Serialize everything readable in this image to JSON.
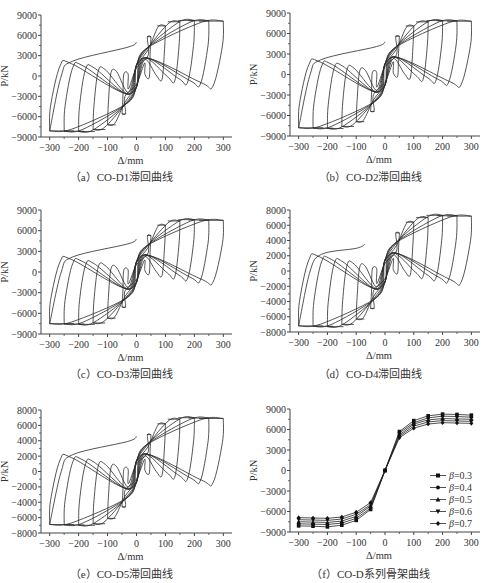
{
  "chart_data": [
    {
      "id": "a",
      "type": "line",
      "subtype": "hysteresis",
      "title": "（a）CO-D1滞回曲线",
      "caption_prefix": "（a）",
      "caption_text": "CO-D1滞回曲线",
      "xlabel": "Δ/mm",
      "ylabel": "P/kN",
      "xlim": [
        -330,
        330
      ],
      "ylim": [
        -9000,
        9000
      ],
      "xticks": [
        -300,
        -200,
        -100,
        0,
        100,
        200,
        300
      ],
      "yticks": [
        -9000,
        -6000,
        -3000,
        0,
        3000,
        6000,
        9000
      ],
      "cycle_peaks_mm": [
        50,
        100,
        150,
        200,
        250,
        300
      ],
      "peak_pos_kN": [
        5800,
        7400,
        8000,
        8200,
        8150,
        8100
      ],
      "peak_neg_kN": [
        -5600,
        -7200,
        -7900,
        -8200,
        -8150,
        -8100
      ],
      "initial_branch_end": [
        0,
        5000
      ]
    },
    {
      "id": "b",
      "type": "line",
      "subtype": "hysteresis",
      "title": "（b）CO-D2滞回曲线",
      "caption_prefix": "（b）",
      "caption_text": "CO-D2滞回曲线",
      "xlabel": "Δ/mm",
      "ylabel": "P/kN",
      "xlim": [
        -330,
        330
      ],
      "ylim": [
        -9000,
        9000
      ],
      "xticks": [
        -300,
        -200,
        -100,
        0,
        100,
        200,
        300
      ],
      "yticks": [
        -9000,
        -6000,
        -3000,
        0,
        3000,
        6000,
        9000
      ],
      "cycle_peaks_mm": [
        50,
        100,
        150,
        200,
        250,
        300
      ],
      "peak_pos_kN": [
        5600,
        7100,
        7700,
        7900,
        7850,
        7800
      ],
      "peak_neg_kN": [
        -5400,
        -6900,
        -7600,
        -7900,
        -7850,
        -7800
      ],
      "initial_branch_end": [
        0,
        4800
      ]
    },
    {
      "id": "c",
      "type": "line",
      "subtype": "hysteresis",
      "title": "（c）CO-D3滞回曲线",
      "caption_prefix": "（c）",
      "caption_text": "CO-D3滞回曲线",
      "xlabel": "Δ/mm",
      "ylabel": "P/kN",
      "xlim": [
        -330,
        330
      ],
      "ylim": [
        -9000,
        9000
      ],
      "xticks": [
        -300,
        -200,
        -100,
        0,
        100,
        200,
        300
      ],
      "yticks": [
        -9000,
        -6000,
        -3000,
        0,
        3000,
        6000,
        9000
      ],
      "cycle_peaks_mm": [
        50,
        100,
        150,
        200,
        250,
        300
      ],
      "peak_pos_kN": [
        5300,
        6800,
        7400,
        7600,
        7550,
        7500
      ],
      "peak_neg_kN": [
        -5100,
        -6700,
        -7400,
        -7600,
        -7550,
        -7500
      ],
      "initial_branch_end": [
        0,
        4800
      ]
    },
    {
      "id": "d",
      "type": "line",
      "subtype": "hysteresis",
      "title": "（d）CO-D4滞回曲线",
      "caption_prefix": "（d）",
      "caption_text": "CO-D4滞回曲线",
      "xlabel": "Δ/mm",
      "ylabel": "P/kN",
      "xlim": [
        -330,
        330
      ],
      "ylim": [
        -8000,
        8000
      ],
      "xticks": [
        -300,
        -200,
        -100,
        0,
        100,
        200,
        300
      ],
      "yticks": [
        -8000,
        -6000,
        -4000,
        -2000,
        0,
        2000,
        4000,
        6000,
        8000
      ],
      "cycle_peaks_mm": [
        50,
        100,
        150,
        200,
        250,
        300
      ],
      "peak_pos_kN": [
        5000,
        6400,
        7000,
        7300,
        7250,
        7200
      ],
      "peak_neg_kN": [
        -4900,
        -6300,
        -7000,
        -7300,
        -7250,
        -7200
      ],
      "initial_branch_end": [
        -70,
        3500
      ]
    },
    {
      "id": "e",
      "type": "line",
      "subtype": "hysteresis",
      "title": "（e）CO-D5滞回曲线",
      "caption_prefix": "（e）",
      "caption_text": "CO-D5滞回曲线",
      "xlabel": "Δ/mm",
      "ylabel": "P/kN",
      "xlim": [
        -330,
        330
      ],
      "ylim": [
        -8000,
        8000
      ],
      "xticks": [
        -300,
        -200,
        -100,
        0,
        100,
        200,
        300
      ],
      "yticks": [
        -8000,
        -6000,
        -4000,
        -2000,
        0,
        2000,
        4000,
        6000,
        8000
      ],
      "cycle_peaks_mm": [
        50,
        100,
        150,
        200,
        250,
        300
      ],
      "peak_pos_kN": [
        4800,
        6200,
        6800,
        7000,
        6950,
        6900
      ],
      "peak_neg_kN": [
        -4600,
        -6100,
        -6800,
        -7000,
        -6950,
        -6900
      ],
      "initial_branch_end": [
        0,
        4600
      ]
    },
    {
      "id": "f",
      "type": "line",
      "subtype": "skeleton",
      "title": "（f）CO-D系列骨架曲线",
      "caption_prefix": "（f）",
      "caption_text": "CO-D系列骨架曲线",
      "xlabel": "Δ/mm",
      "ylabel": "P/kN",
      "xlim": [
        -330,
        330
      ],
      "ylim": [
        -9000,
        9000
      ],
      "xticks": [
        -300,
        -200,
        -100,
        0,
        100,
        200,
        300
      ],
      "yticks": [
        -9000,
        -6000,
        -3000,
        0,
        3000,
        6000,
        9000
      ],
      "legend_position": "lower right",
      "x": [
        -300,
        -250,
        -200,
        -150,
        -100,
        -50,
        0,
        50,
        100,
        150,
        200,
        250,
        300
      ],
      "series": [
        {
          "name": "β=0.3",
          "marker": "square",
          "values": [
            -8100,
            -8150,
            -8250,
            -8000,
            -7300,
            -5700,
            0,
            5700,
            7300,
            8000,
            8250,
            8200,
            8100
          ]
        },
        {
          "name": "β=0.4",
          "marker": "circle",
          "values": [
            -7800,
            -7850,
            -7900,
            -7700,
            -7000,
            -5500,
            0,
            5500,
            7000,
            7700,
            7950,
            7900,
            7800
          ]
        },
        {
          "name": "β=0.5",
          "marker": "triangle-up",
          "values": [
            -7500,
            -7550,
            -7600,
            -7400,
            -6700,
            -5200,
            0,
            5200,
            6800,
            7400,
            7600,
            7550,
            7500
          ]
        },
        {
          "name": "β=0.6",
          "marker": "triangle-down",
          "values": [
            -7200,
            -7250,
            -7300,
            -7100,
            -6400,
            -5000,
            0,
            5000,
            6500,
            7100,
            7300,
            7250,
            7200
          ]
        },
        {
          "name": "β=0.7",
          "marker": "diamond",
          "values": [
            -6900,
            -6950,
            -7000,
            -6800,
            -6100,
            -4700,
            0,
            4800,
            6200,
            6800,
            7000,
            6950,
            6900
          ]
        }
      ]
    }
  ]
}
